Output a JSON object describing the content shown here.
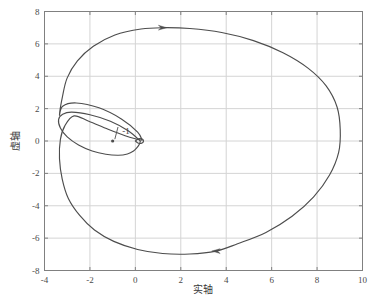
{
  "chart_data": {
    "type": "line",
    "title": "",
    "xlabel": "实轴",
    "ylabel": "虚轴",
    "xlim": [
      -4,
      10
    ],
    "ylim": [
      -8,
      8
    ],
    "grid": true,
    "legend_position": "none",
    "xticks": [
      "-4",
      "-2",
      "0",
      "2",
      "4",
      "6",
      "8",
      "10"
    ],
    "xtick_values": [
      -4,
      -2,
      0,
      2,
      4,
      6,
      8,
      10
    ],
    "yticks": [
      "-8",
      "-6",
      "-4",
      "-2",
      "0",
      "2",
      "4",
      "6",
      "8"
    ],
    "ytick_values": [
      -8,
      -6,
      -4,
      -2,
      0,
      2,
      4,
      6,
      8
    ],
    "series": [
      {
        "name": "outer-lobe",
        "color": "#4d4d4d",
        "points": [
          [
            0.22,
            0.0
          ],
          [
            -0.3,
            0.62
          ],
          [
            -1.1,
            1.22
          ],
          [
            -2.0,
            1.62
          ],
          [
            -2.8,
            1.78
          ],
          [
            -3.2,
            1.65
          ],
          [
            -3.38,
            1.32
          ],
          [
            -3.3,
            0.8
          ],
          [
            -3.0,
            0.25
          ],
          [
            -2.5,
            -0.25
          ],
          [
            -1.9,
            -0.62
          ],
          [
            -1.3,
            -0.82
          ],
          [
            -0.75,
            -0.88
          ],
          [
            -0.35,
            -0.8
          ],
          [
            -0.08,
            -0.62
          ],
          [
            0.08,
            -0.4
          ],
          [
            0.18,
            -0.18
          ],
          [
            0.22,
            0.0
          ]
        ]
      },
      {
        "name": "main-nyquist-contour",
        "color": "#4d4d4d",
        "points": [
          [
            0.3,
            0.05
          ],
          [
            0.1,
            0.55
          ],
          [
            -0.6,
            1.35
          ],
          [
            -1.6,
            2.05
          ],
          [
            -2.6,
            2.35
          ],
          [
            -3.2,
            2.15
          ],
          [
            -3.34,
            1.6
          ],
          [
            -3.2,
            2.8
          ],
          [
            -3.0,
            3.9
          ],
          [
            -2.55,
            4.95
          ],
          [
            -1.85,
            5.85
          ],
          [
            -0.9,
            6.55
          ],
          [
            0.25,
            6.92
          ],
          [
            1.2,
            7.0
          ],
          [
            2.4,
            6.95
          ],
          [
            3.8,
            6.7
          ],
          [
            5.2,
            6.2
          ],
          [
            6.5,
            5.45
          ],
          [
            7.6,
            4.5
          ],
          [
            8.4,
            3.4
          ],
          [
            8.88,
            2.1
          ],
          [
            9.02,
            0.7
          ],
          [
            8.95,
            -0.7
          ],
          [
            8.55,
            -2.1
          ],
          [
            7.85,
            -3.45
          ],
          [
            6.9,
            -4.65
          ],
          [
            5.75,
            -5.65
          ],
          [
            4.5,
            -6.35
          ],
          [
            3.55,
            -6.8
          ],
          [
            2.4,
            -6.98
          ],
          [
            1.2,
            -6.95
          ],
          [
            0.1,
            -6.7
          ],
          [
            -0.95,
            -6.2
          ],
          [
            -1.8,
            -5.5
          ],
          [
            -2.45,
            -4.6
          ],
          [
            -2.95,
            -3.55
          ],
          [
            -3.22,
            -2.35
          ],
          [
            -3.34,
            -1.1
          ],
          [
            -3.3,
            0.1
          ],
          [
            -3.1,
            0.95
          ],
          [
            -2.7,
            1.55
          ],
          [
            -2.05,
            1.22
          ],
          [
            -1.2,
            0.72
          ],
          [
            -0.45,
            0.32
          ],
          [
            0.05,
            0.12
          ],
          [
            0.3,
            0.05
          ]
        ]
      },
      {
        "name": "origin-loop",
        "color": "#4d4d4d",
        "points": [
          [
            0.0,
            0.0
          ],
          [
            0.14,
            0.14
          ],
          [
            0.3,
            0.12
          ],
          [
            0.36,
            0.0
          ],
          [
            0.3,
            -0.12
          ],
          [
            0.14,
            -0.14
          ],
          [
            0.0,
            0.0
          ]
        ]
      }
    ],
    "annotations": [
      {
        "name": "critical-point-label",
        "text": "-1",
        "x": -0.72,
        "y": 1.05,
        "points_to": [
          -1.0,
          0.0
        ],
        "marker": "arrow"
      }
    ],
    "direction_markers": [
      {
        "name": "arrow-top",
        "x": 1.2,
        "y": 7.0,
        "direction": "right"
      },
      {
        "name": "arrow-bottom",
        "x": 3.55,
        "y": -6.8,
        "direction": "left"
      }
    ],
    "critical_point": {
      "x": -1,
      "y": 0,
      "label": "-1"
    }
  },
  "style": {
    "curve_color": "#4d4d4d",
    "grid_color": "#d4d4d4",
    "frame_color": "#808080",
    "tick_text_color": "#4a4a4a",
    "axis_label_color": "#3a3a3a",
    "background": "#ffffff"
  }
}
